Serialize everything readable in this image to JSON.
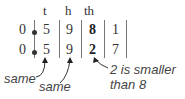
{
  "headers": [
    "t",
    "h",
    "th"
  ],
  "rows": [
    {
      "units": "0",
      "t": "5",
      "h": "9",
      "th": "8",
      "tth": "1"
    },
    {
      "units": "0",
      "t": "5",
      "h": "9",
      "th": "2",
      "tth": "7"
    }
  ],
  "annotations": {
    "same_1": "same",
    "same_2": "same",
    "smaller_line1": "2 is smaller",
    "smaller_line2": "than 8"
  }
}
